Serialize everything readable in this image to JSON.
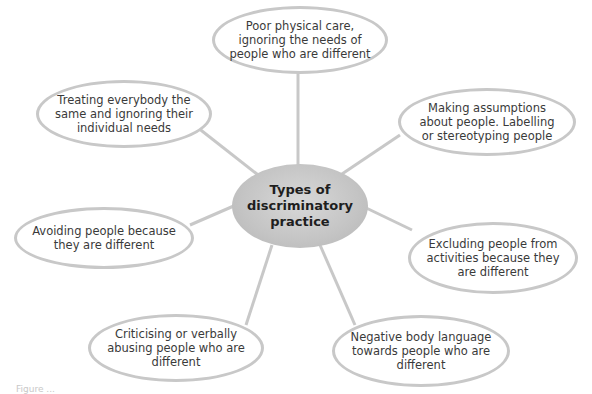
{
  "diagram": {
    "type": "spider",
    "center": {
      "label": "Types of discriminatory practice"
    },
    "nodes": [
      {
        "id": "top",
        "label": "Poor physical care, ignoring the needs of people who are different"
      },
      {
        "id": "upper-left",
        "label": "Treating everybody the same and ignoring their individual needs"
      },
      {
        "id": "upper-right",
        "label": "Making assumptions about people. Labelling or stereotyping people"
      },
      {
        "id": "left",
        "label": "Avoiding people because they are different"
      },
      {
        "id": "right",
        "label": "Excluding people from activities because they are different"
      },
      {
        "id": "lower-left",
        "label": "Criticising or verbally abusing people who are different"
      },
      {
        "id": "lower-right",
        "label": "Negative body language towards people who are different"
      }
    ],
    "colors": {
      "node_border": "#c8c8c8",
      "connector": "#c8c8c8",
      "center_fill": "#c4c4c4",
      "text": "#3a3a3a"
    }
  },
  "caption": {
    "text": "Figure ..."
  }
}
